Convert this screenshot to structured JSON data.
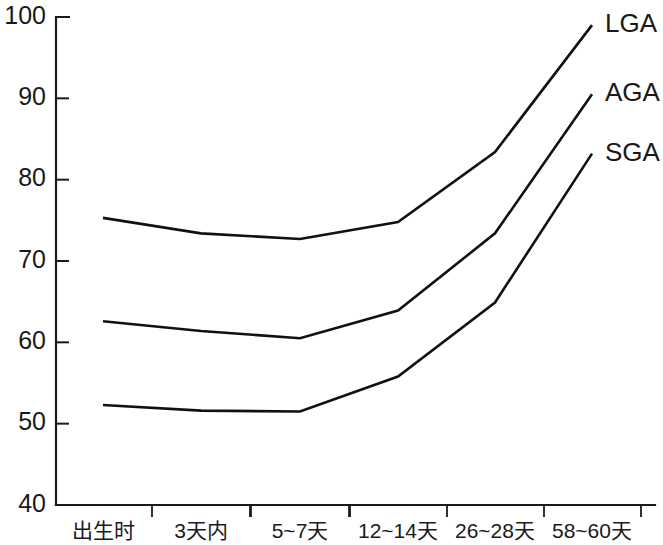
{
  "chart_data": {
    "type": "line",
    "title": "",
    "subtitle": "",
    "xlabel": "",
    "ylabel": "",
    "categories": [
      "出生时",
      "3天内",
      "5~7天",
      "12~14天",
      "26~28天",
      "58~60天"
    ],
    "ylim": [
      40,
      100
    ],
    "yticks": [
      40,
      50,
      60,
      70,
      80,
      90,
      100
    ],
    "ytick_labels": [
      "40",
      "50",
      "60",
      "70",
      "80",
      "90",
      "100"
    ],
    "grid": false,
    "legend_position": "right-inline-end-of-line",
    "line_color": "#111111",
    "series": [
      {
        "name": "LGA",
        "label": "LGA",
        "values": [
          75.3,
          73.4,
          72.7,
          74.8,
          83.4,
          99.0
        ]
      },
      {
        "name": "AGA",
        "label": "AGA",
        "values": [
          62.6,
          61.4,
          60.5,
          63.9,
          73.4,
          90.5
        ]
      },
      {
        "name": "SGA",
        "label": "SGA",
        "values": [
          52.3,
          51.6,
          51.5,
          55.8,
          64.9,
          83.2
        ]
      }
    ]
  },
  "legend": {
    "items": [
      "LGA",
      "AGA",
      "SGA"
    ]
  }
}
